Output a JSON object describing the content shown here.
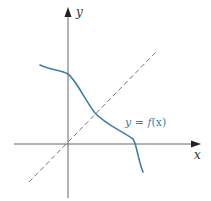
{
  "diagram": {
    "type": "function-graph",
    "axes": {
      "x_label": "x",
      "y_label": "y",
      "color": "#666666"
    },
    "reference_line": {
      "description": "dashed line y = x",
      "color": "#777777"
    },
    "curve": {
      "label_y": "y",
      "label_eq": " = ",
      "label_f": "f",
      "label_arg": "(x)",
      "label_full": "y = f(x)",
      "color": "#3f7fa8"
    }
  }
}
